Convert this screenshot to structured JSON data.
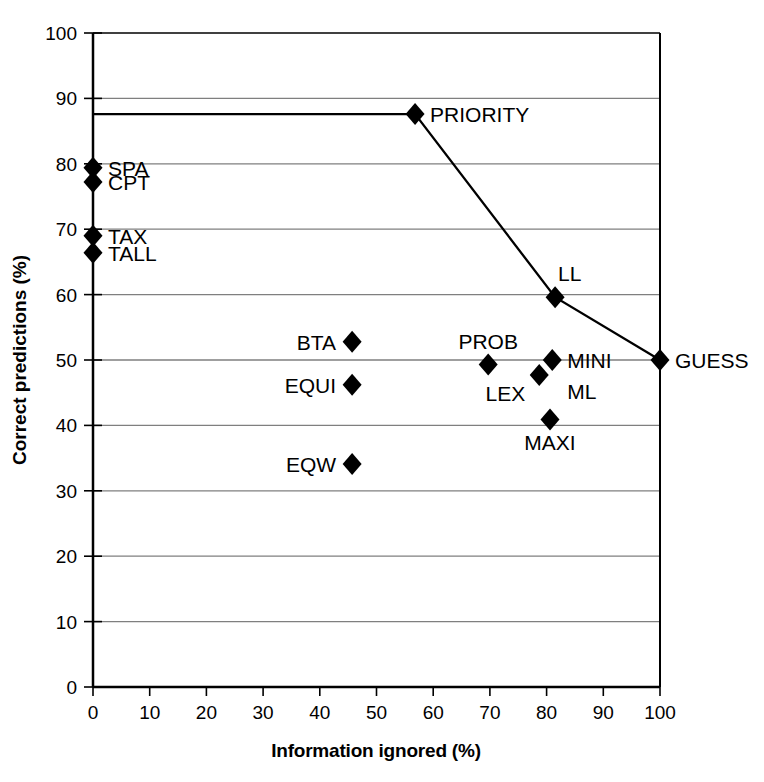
{
  "chart_data": {
    "type": "scatter",
    "title": "",
    "xlabel": "Information ignored (%)",
    "ylabel": "Correct predictions (%)",
    "xlim": [
      0,
      100
    ],
    "ylim": [
      0,
      100
    ],
    "xticks": [
      "0",
      "10",
      "20",
      "30",
      "40",
      "50",
      "60",
      "70",
      "80",
      "90",
      "100"
    ],
    "yticks": [
      "0",
      "10",
      "20",
      "30",
      "40",
      "50",
      "60",
      "70",
      "80",
      "90",
      "100"
    ],
    "grid": "horizontal",
    "legend": "none",
    "points": [
      {
        "label": "SPA",
        "x": 0,
        "y": 79.4,
        "label_pos": "right"
      },
      {
        "label": "CPT",
        "x": 0,
        "y": 77.2,
        "label_pos": "right"
      },
      {
        "label": "TAX",
        "x": 0,
        "y": 69.0,
        "label_pos": "right"
      },
      {
        "label": "TALL",
        "x": 0,
        "y": 66.4,
        "label_pos": "right"
      },
      {
        "label": "PRIORITY",
        "x": 56.8,
        "y": 87.6,
        "label_pos": "right"
      },
      {
        "label": "LL",
        "x": 81.5,
        "y": 59.6,
        "label_pos": "above-right"
      },
      {
        "label": "GUESS",
        "x": 100,
        "y": 50.0,
        "label_pos": "right"
      },
      {
        "label": "BTA",
        "x": 45.7,
        "y": 52.8,
        "label_pos": "left"
      },
      {
        "label": "EQUI",
        "x": 45.7,
        "y": 46.2,
        "label_pos": "left"
      },
      {
        "label": "EQW",
        "x": 45.7,
        "y": 34.1,
        "label_pos": "left"
      },
      {
        "label": "PROB",
        "x": 69.7,
        "y": 49.3,
        "label_pos": "above"
      },
      {
        "label": "MINI",
        "x": 81.0,
        "y": 50.0,
        "label_pos": "right"
      },
      {
        "label": "ML",
        "x": 78.7,
        "y": 47.7,
        "label_pos": "far-right"
      },
      {
        "label": "LEX",
        "x": 78.7,
        "y": 47.7,
        "label_pos": "below-left"
      },
      {
        "label": "MAXI",
        "x": 80.6,
        "y": 40.9,
        "label_pos": "below"
      }
    ],
    "frontier_line": {
      "name": "efficient frontier",
      "points": [
        {
          "x": 0,
          "y": 87.6
        },
        {
          "x": 56.8,
          "y": 87.6
        },
        {
          "x": 81.5,
          "y": 59.6
        },
        {
          "x": 100,
          "y": 50.0
        }
      ]
    },
    "colors": {
      "marker": "#000000",
      "line": "#000000",
      "grid": "#7f7f7f",
      "axis": "#000000",
      "background": "#ffffff"
    }
  }
}
